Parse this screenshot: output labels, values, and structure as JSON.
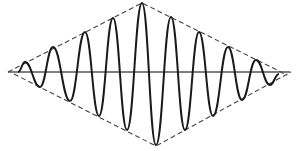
{
  "diagram": {
    "title": "",
    "colors": {
      "background": "#ffffff",
      "wave": "#1a1a1a",
      "axis": "#555555",
      "envelope": "#444444"
    },
    "axis": {
      "x1": 8,
      "x2": 290,
      "y": 72
    },
    "envelope": {
      "upper": [
        [
          8,
          72
        ],
        [
          142,
          3
        ],
        [
          287,
          75
        ]
      ],
      "lower": [
        [
          14,
          74
        ],
        [
          156,
          146
        ],
        [
          291,
          72
        ]
      ]
    },
    "wave": {
      "peaks": [
        [
          25,
          62
        ],
        [
          53,
          47
        ],
        [
          85,
          32
        ],
        [
          113,
          18
        ],
        [
          142,
          3
        ],
        [
          171,
          17
        ],
        [
          199,
          32
        ],
        [
          228,
          47
        ],
        [
          256,
          60
        ]
      ],
      "troughs": [
        [
          40,
          87
        ],
        [
          70,
          101
        ],
        [
          99,
          116
        ],
        [
          127,
          130
        ],
        [
          156,
          145
        ],
        [
          185,
          130
        ],
        [
          213,
          116
        ],
        [
          242,
          100
        ],
        [
          270,
          85
        ]
      ],
      "start": [
        18,
        72
      ],
      "end": [
        279,
        74
      ]
    }
  }
}
